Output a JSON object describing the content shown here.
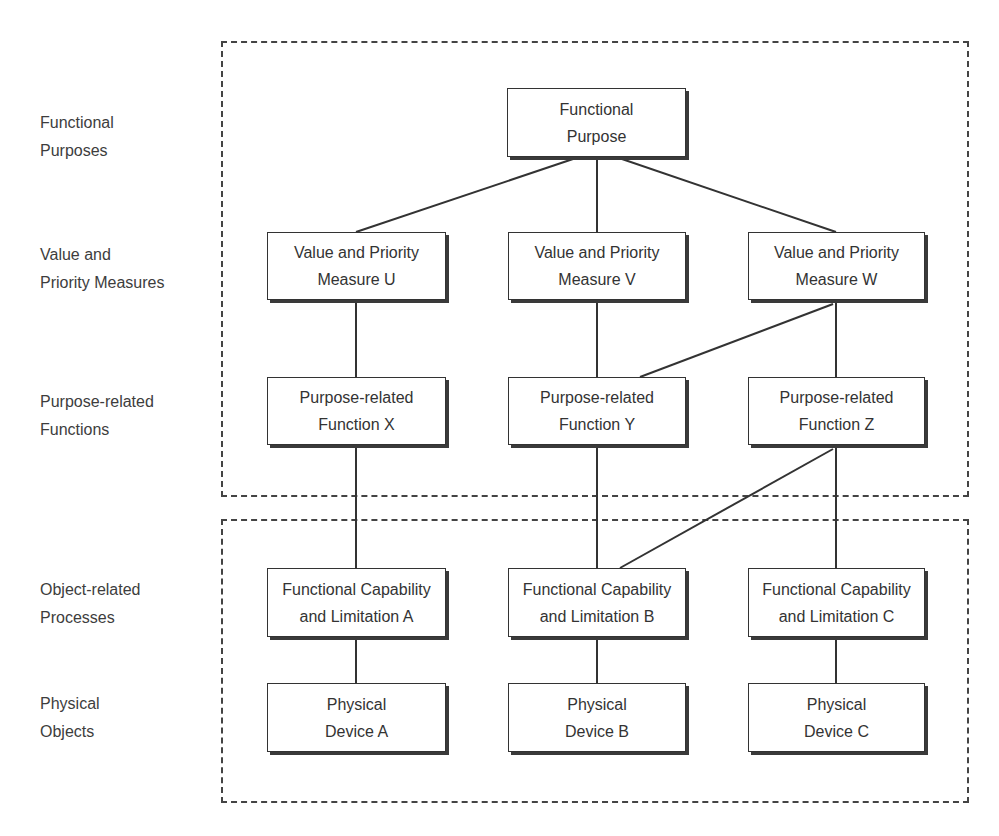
{
  "row_labels": [
    {
      "id": "functional-purposes",
      "lines": [
        "Functional",
        "Purposes"
      ]
    },
    {
      "id": "value-priority-measures",
      "lines": [
        "Value and",
        "Priority Measures"
      ]
    },
    {
      "id": "purpose-related-functions",
      "lines": [
        "Purpose-related",
        "Functions"
      ]
    },
    {
      "id": "object-related-processes",
      "lines": [
        "Object-related",
        "Processes"
      ]
    },
    {
      "id": "physical-objects",
      "lines": [
        "Physical",
        "Objects"
      ]
    }
  ],
  "nodes": {
    "functional_purpose": {
      "lines": [
        "Functional",
        "Purpose"
      ]
    },
    "measure_u": {
      "lines": [
        "Value and Priority",
        "Measure  U"
      ]
    },
    "measure_v": {
      "lines": [
        "Value and Priority",
        "Measure  V"
      ]
    },
    "measure_w": {
      "lines": [
        "Value and Priority",
        "Measure  W"
      ]
    },
    "function_x": {
      "lines": [
        "Purpose-related",
        "Function  X"
      ]
    },
    "function_y": {
      "lines": [
        "Purpose-related",
        "Function  Y"
      ]
    },
    "function_z": {
      "lines": [
        "Purpose-related",
        "Function  Z"
      ]
    },
    "capability_a": {
      "lines": [
        "Functional Capability",
        "and Limitation  A"
      ]
    },
    "capability_b": {
      "lines": [
        "Functional Capability",
        "and Limitation  B"
      ]
    },
    "capability_c": {
      "lines": [
        "Functional Capability",
        "and Limitation  C"
      ]
    },
    "device_a": {
      "lines": [
        "Physical",
        "Device  A"
      ]
    },
    "device_b": {
      "lines": [
        "Physical",
        "Device  B"
      ]
    },
    "device_c": {
      "lines": [
        "Physical",
        "Device  C"
      ]
    }
  },
  "edges": [
    [
      "functional_purpose",
      "measure_u"
    ],
    [
      "functional_purpose",
      "measure_v"
    ],
    [
      "functional_purpose",
      "measure_w"
    ],
    [
      "measure_u",
      "function_x"
    ],
    [
      "measure_v",
      "function_y"
    ],
    [
      "measure_w",
      "function_y"
    ],
    [
      "measure_w",
      "function_z"
    ],
    [
      "function_x",
      "capability_a"
    ],
    [
      "function_y",
      "capability_b"
    ],
    [
      "function_z",
      "capability_b"
    ],
    [
      "function_z",
      "capability_c"
    ],
    [
      "capability_a",
      "device_a"
    ],
    [
      "capability_b",
      "device_b"
    ],
    [
      "capability_c",
      "device_c"
    ]
  ],
  "groups": [
    "purpose-domain",
    "physical-domain"
  ]
}
